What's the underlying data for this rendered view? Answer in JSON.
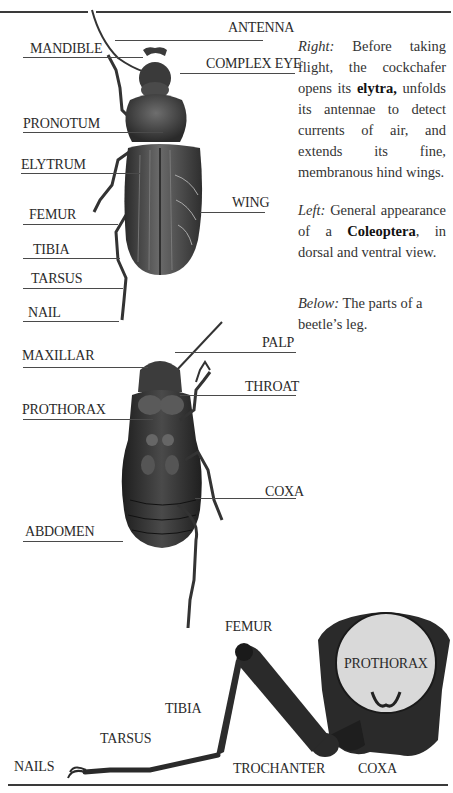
{
  "page": {
    "top_rule": true,
    "bottom_rule": true
  },
  "dorsal_view": {
    "labels": [
      {
        "id": "antenna",
        "text": "ANTENNA"
      },
      {
        "id": "mandible",
        "text": "MANDIBLE"
      },
      {
        "id": "complex_eye",
        "text": "COMPLEX EYE"
      },
      {
        "id": "pronotum",
        "text": "PRONOTUM"
      },
      {
        "id": "elytrum",
        "text": "ELYTRUM"
      },
      {
        "id": "wing",
        "text": "WING"
      },
      {
        "id": "femur",
        "text": "FEMUR"
      },
      {
        "id": "tibia",
        "text": "TIBIA"
      },
      {
        "id": "tarsus",
        "text": "TARSUS"
      },
      {
        "id": "nail",
        "text": "NAIL"
      }
    ]
  },
  "ventral_view": {
    "labels": [
      {
        "id": "maxillar",
        "text": "MAXILLAR"
      },
      {
        "id": "palp",
        "text": "PALP"
      },
      {
        "id": "throat",
        "text": "THROAT"
      },
      {
        "id": "prothorax",
        "text": "PROTHORAX"
      },
      {
        "id": "coxa",
        "text": "COXA"
      },
      {
        "id": "abdomen",
        "text": "ABDOMEN"
      }
    ]
  },
  "leg_view": {
    "labels": [
      {
        "id": "femur",
        "text": "FEMUR"
      },
      {
        "id": "prothorax",
        "text": "PROTHORAX"
      },
      {
        "id": "tibia",
        "text": "TIBIA"
      },
      {
        "id": "tarsus",
        "text": "TARSUS"
      },
      {
        "id": "nails",
        "text": "NAILS"
      },
      {
        "id": "trochanter",
        "text": "TROCHANTER"
      },
      {
        "id": "coxa",
        "text": "COXA"
      }
    ]
  },
  "captions": {
    "right": {
      "lead": "Right:",
      "text_1": " Before taking flight, the cockchafer opens its ",
      "bold": "elytra,",
      "text_2": " unfolds its antennae to detect currents of air, and extends its fine, membranous hind wings."
    },
    "left": {
      "lead": "Left:",
      "text_1": " General appearance of a ",
      "bold": "Coleoptera",
      "text_2": ", in dorsal and ventral view."
    },
    "below": {
      "lead": "Below:",
      "text_1": " The parts of a beetle’s leg."
    }
  },
  "colors": {
    "ink": "#2a2a2a",
    "beetle_dark": "#2b2b2b",
    "beetle_mid": "#5a5a5a",
    "prothorax_disc": "#d9d9d9"
  }
}
